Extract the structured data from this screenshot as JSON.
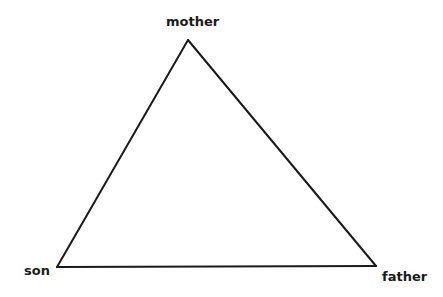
{
  "diagram": {
    "type": "triangle",
    "stroke_color": "#1a1a1a",
    "vertices": [
      {
        "id": "mother",
        "label": "mother",
        "position": "top"
      },
      {
        "id": "son",
        "label": "son",
        "position": "bottom-left"
      },
      {
        "id": "father",
        "label": "father",
        "position": "bottom-right"
      }
    ],
    "edges": [
      {
        "from": "mother",
        "to": "son"
      },
      {
        "from": "son",
        "to": "father"
      },
      {
        "from": "father",
        "to": "mother"
      }
    ]
  }
}
